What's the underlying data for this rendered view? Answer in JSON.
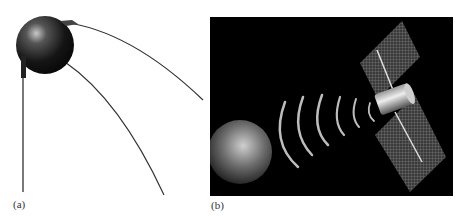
{
  "figure": {
    "panels": [
      {
        "id": "a",
        "label": "(a)",
        "description": "Sputnik satellite with four antennas"
      },
      {
        "id": "b",
        "label": "(b)",
        "description": "Satellite with solar panels transmitting signal waves toward Earth"
      }
    ]
  },
  "colors": {
    "background": "#ffffff",
    "space": "#000000",
    "sphere": "#2a2a2a",
    "panel_grid": "#8a8a8a"
  }
}
